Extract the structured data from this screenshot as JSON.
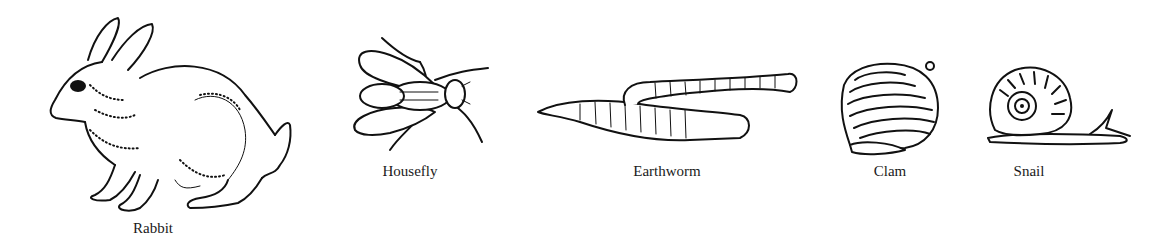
{
  "figure": {
    "animals": [
      {
        "id": "rabbit",
        "label": "Rabbit"
      },
      {
        "id": "housefly",
        "label": "Housefly"
      },
      {
        "id": "earthworm",
        "label": "Earthworm"
      },
      {
        "id": "clam",
        "label": "Clam"
      },
      {
        "id": "snail",
        "label": "Snail"
      }
    ]
  }
}
